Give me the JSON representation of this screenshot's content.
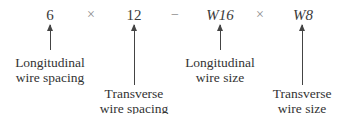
{
  "expression": {
    "terms": [
      {
        "text": "6",
        "italic": false
      },
      {
        "text": "×",
        "role": "operator"
      },
      {
        "text": "12",
        "italic": false
      },
      {
        "text": "−",
        "role": "operator"
      },
      {
        "text": "W16",
        "italic": true
      },
      {
        "text": "×",
        "role": "operator"
      },
      {
        "text": "W8",
        "italic": true
      }
    ]
  },
  "labels": [
    {
      "for": "6",
      "line1": "Longitudinal",
      "line2": "wire spacing"
    },
    {
      "for": "12",
      "line1": "Transverse",
      "line2": "wire spacing"
    },
    {
      "for": "W16",
      "line1": "Longitudinal",
      "line2": "wire size"
    },
    {
      "for": "W8",
      "line1": "Transverse",
      "line2": "wire size"
    }
  ]
}
